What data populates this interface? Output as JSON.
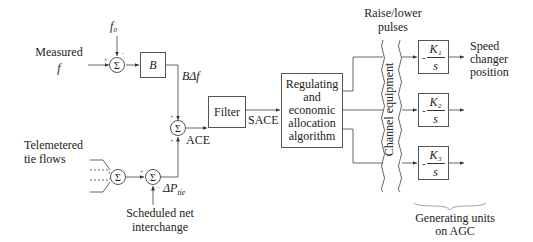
{
  "diagram": {
    "inputs": {
      "measured_f": {
        "line1": "Measured",
        "line2": "f"
      },
      "f0": "f₀",
      "telemetered": {
        "line1": "Telemetered",
        "line2": "tie flows"
      },
      "scheduled": {
        "line1": "Scheduled  net",
        "line2": "interchange"
      }
    },
    "symbols": {
      "sum": "Σ"
    },
    "blocks": {
      "B": "B",
      "filter": "Filter",
      "regulating": [
        "Regulating",
        "and",
        "economic",
        "allocation",
        "algorithm"
      ],
      "k1": {
        "num": "K₁",
        "den": "s",
        "sign": "-"
      },
      "k2": {
        "num": "K₂",
        "den": "s",
        "sign": "-"
      },
      "k3": {
        "num": "K₃",
        "den": "s",
        "sign": "-"
      }
    },
    "signals": {
      "b_delta_f": "BΔf",
      "ace": "ACE",
      "sace": "SACE",
      "delta_p_tie": "ΔP",
      "delta_p_tie_sub": "tie"
    },
    "labels": {
      "raise_lower": {
        "line1": "Raise/lower",
        "line2": "pulses"
      },
      "channel": "Channel  equipment",
      "speed_changer": {
        "line1": "Speed",
        "line2": "changer",
        "line3": "position"
      },
      "generating_units": {
        "line1": "Generating  units",
        "line2": "on AGC"
      }
    },
    "signs": {
      "plus": "+",
      "minus": "−"
    }
  }
}
